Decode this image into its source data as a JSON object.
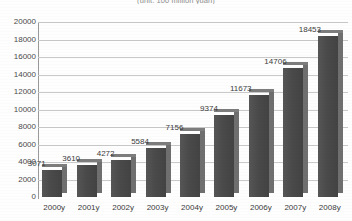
{
  "chart_data": {
    "type": "bar",
    "title": "(unit: 100 million yuan)",
    "xlabel": "",
    "ylabel": "",
    "ylim": [
      0,
      20000
    ],
    "ytick_step": 2000,
    "grid": true,
    "legend": "none",
    "style": "3d-grayscale",
    "categories": [
      "2000y",
      "2001y",
      "2002y",
      "2003y",
      "2004y",
      "2005y",
      "2006y",
      "2007y",
      "2008y"
    ],
    "values": [
      3071,
      3610,
      4272,
      5584,
      7156,
      9374,
      11673,
      14706,
      18453
    ],
    "data_labels": [
      "3071",
      "3610",
      "4272",
      "5584",
      "7156",
      "9374",
      "11673",
      "14706",
      "18453"
    ],
    "ytick_labels": [
      "0",
      "2000",
      "4000",
      "6000",
      "8000",
      "10000",
      "12000",
      "14000",
      "16000",
      "18000",
      "20000"
    ],
    "colors": {
      "bar_front": "#4a4a4a",
      "bar_side": "#6f6f6f",
      "bar_top": "#7d7d7d",
      "gridline": "#c9c9c9",
      "axis": "#9a9a9a",
      "text": "#3c3c3c",
      "background": "#ffffff"
    }
  }
}
